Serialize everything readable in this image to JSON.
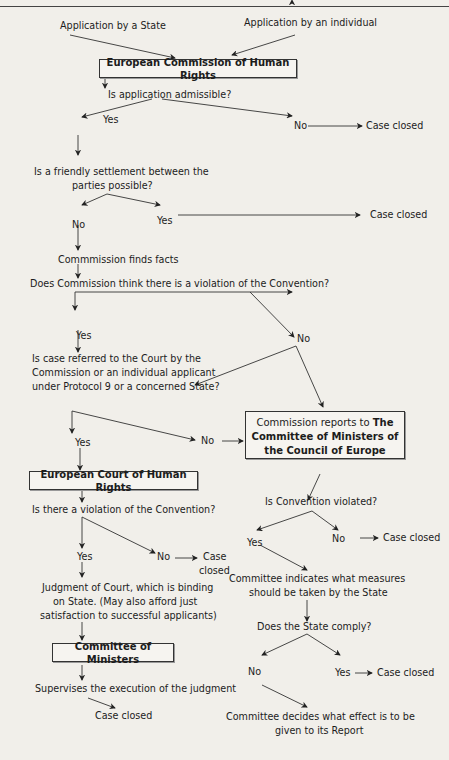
{
  "header_fragment": "g  .    .  ",
  "nodes": {
    "app_state": "Application by a State",
    "app_individual": "Application by an individual",
    "commission": "European Commission of Human Rights",
    "admissible_q": "Is application admissible?",
    "admissible_yes": "Yes",
    "admissible_no": "No",
    "admissible_no_closed": "Case closed",
    "friendly_q_line1": "Is a friendly settlement between the",
    "friendly_q_line2": "parties possible?",
    "friendly_no": "No",
    "friendly_yes": "Yes",
    "friendly_yes_closed": "Case closed",
    "finds_facts": "Commmission finds facts",
    "violation_q": "Does Commission think there is a violation of the Convention?",
    "violation_yes": "Yes",
    "violation_no": "No",
    "referred_q_line1": "Is case referred to the Court by the",
    "referred_q_line2": "Commission or an individual applicant",
    "referred_q_line3": "under Protocol 9 or a concerned State?",
    "referred_yes": "Yes",
    "referred_no": "No",
    "reports_line1_plain": "Commission reports to ",
    "reports_line1_bold": "The",
    "reports_line2": "Committee of Ministers of",
    "reports_line3": "the Council of Europe",
    "court": "European Court of Human Rights",
    "court_violation_q": "Is there a violation of the Convention?",
    "court_yes": "Yes",
    "court_no": "No",
    "court_no_closed_line1": "Case",
    "court_no_closed_line2": "closed",
    "judgment_line1": "Judgment of Court, which is binding",
    "judgment_line2": "on State. (May also afford just",
    "judgment_line3": "satisfaction to successful applicants)",
    "committee_ministers": "Committee of Ministers",
    "supervises": "Supervises the execution of the judgment",
    "supervises_closed": "Case closed",
    "conv_violated_q": "Is Convention violated?",
    "conv_yes": "Yes",
    "conv_no": "No",
    "conv_no_closed": "Case closed",
    "measures_line1": "Committee indicates what measures",
    "measures_line2": "should be taken by the State",
    "comply_q": "Does the State comply?",
    "comply_no": "No",
    "comply_yes": "Yes",
    "comply_yes_closed": "Case closed",
    "decides_line1": "Committee decides what effect is to be",
    "decides_line2": "given to its Report"
  }
}
